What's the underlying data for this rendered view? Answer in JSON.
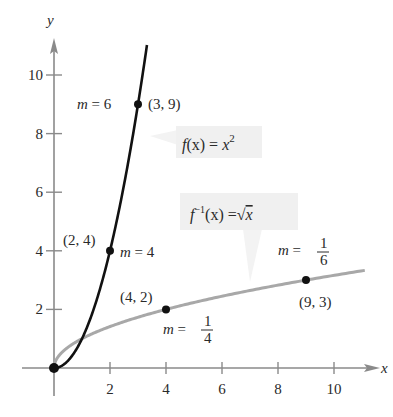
{
  "chart_data": {
    "type": "line",
    "title": "",
    "xlabel": "x",
    "ylabel": "y",
    "xlim": [
      0,
      11.5
    ],
    "ylim": [
      0,
      11
    ],
    "x_ticks": [
      2,
      4,
      6,
      8,
      10
    ],
    "y_ticks": [
      2,
      4,
      6,
      8,
      10
    ],
    "grid": false,
    "legend": null,
    "series": [
      {
        "name": "f(x) = x^2",
        "label": "f(x) = x²",
        "color": "#111111",
        "function": "x^2",
        "domain": [
          0,
          3.32
        ],
        "points": [
          {
            "x": 0,
            "y": 0
          },
          {
            "x": 2,
            "y": 4,
            "label": "(2, 4)",
            "slope_label": "m = 4"
          },
          {
            "x": 3,
            "y": 9,
            "label": "(3, 9)",
            "slope_label": "m = 6"
          }
        ]
      },
      {
        "name": "f^-1(x) = sqrt(x)",
        "label": "f⁻¹(x) = √x",
        "color": "#a8a8a8",
        "function": "sqrt(x)",
        "domain": [
          0,
          11.1
        ],
        "points": [
          {
            "x": 0,
            "y": 0
          },
          {
            "x": 4,
            "y": 2,
            "label": "(4, 2)",
            "slope_label": "m = 1/4"
          },
          {
            "x": 9,
            "y": 3,
            "label": "(9, 3)",
            "slope_label": "m = 1/6"
          }
        ]
      }
    ],
    "annotations": [
      {
        "text": "m = 6",
        "near": [
          3,
          9
        ]
      },
      {
        "text": "(3, 9)",
        "near": [
          3,
          9
        ]
      },
      {
        "text": "(2, 4)",
        "near": [
          2,
          4
        ]
      },
      {
        "text": "m = 4",
        "near": [
          2,
          4
        ]
      },
      {
        "text": "(4, 2)",
        "near": [
          4,
          2
        ]
      },
      {
        "text": "m = 1/4",
        "near": [
          4,
          2
        ]
      },
      {
        "text": "m = 1/6",
        "near": [
          9,
          3
        ]
      },
      {
        "text": "(9, 3)",
        "near": [
          9,
          3
        ]
      },
      {
        "text": "f(x) = x²",
        "type": "function-label"
      },
      {
        "text": "f⁻¹(x) = √x",
        "type": "function-label"
      }
    ]
  },
  "labels": {
    "x_axis": "x",
    "y_axis": "y",
    "f_name": "f",
    "f_arg": "(x) = ",
    "f_var": "x",
    "f_exp": "2",
    "finv_name": "f",
    "finv_exp": "−1",
    "finv_arg": "(x) =",
    "finv_sqrt": "√",
    "finv_var": "x",
    "m": "m",
    "eq": " = ",
    "m6": "6",
    "m4": "4",
    "p39": "(3, 9)",
    "p24": "(2, 4)",
    "p42": "(4, 2)",
    "p93": "(9, 3)",
    "one": "1",
    "four": "4",
    "six": "6"
  },
  "colors": {
    "axis": "#8a8a8a",
    "curve_f": "#111111",
    "curve_finv": "#a8a8a8",
    "point": "#111111",
    "label_box": "#f0f0f0"
  }
}
